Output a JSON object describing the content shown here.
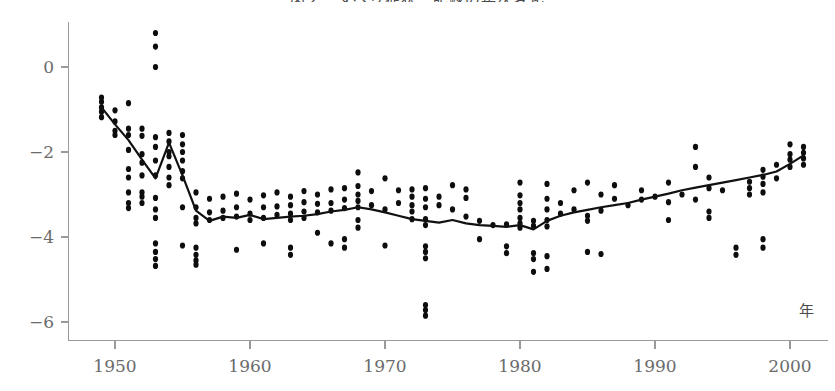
{
  "chart_data": {
    "type": "scatter",
    "title": "図２　すべり症状・記録の年次変化",
    "xlabel": "年",
    "ylabel": "",
    "xlim": [
      1948,
      2001.5
    ],
    "ylim": [
      -6.6,
      1.1
    ],
    "xticks": [
      1950,
      1960,
      1970,
      1980,
      1990,
      2000
    ],
    "xticklabels": [
      "1950",
      "1960",
      "1970",
      "1980",
      "1990",
      "2000"
    ],
    "yticks": [
      0,
      -2,
      -4,
      -6
    ],
    "yticklabels": [
      "0",
      "−2",
      "−4",
      "−6"
    ],
    "grid": false,
    "legend": null,
    "series": [
      {
        "name": "trend-line",
        "type": "line",
        "x": [
          1949,
          1950,
          1951,
          1952,
          1953,
          1954,
          1955,
          1956,
          1957,
          1958,
          1959,
          1960,
          1961,
          1962,
          1963,
          1964,
          1965,
          1966,
          1967,
          1968,
          1969,
          1970,
          1971,
          1972,
          1973,
          1974,
          1975,
          1976,
          1977,
          1978,
          1979,
          1980,
          1981,
          1982,
          1983,
          1984,
          1985,
          1986,
          1987,
          1988,
          1989,
          1990,
          1991,
          1992,
          1993,
          1994,
          1995,
          1996,
          1997,
          1998,
          1999,
          2000,
          2001
        ],
        "y": [
          -0.95,
          -1.35,
          -1.72,
          -2.18,
          -2.62,
          -1.78,
          -2.55,
          -3.38,
          -3.62,
          -3.52,
          -3.55,
          -3.48,
          -3.58,
          -3.55,
          -3.52,
          -3.5,
          -3.46,
          -3.4,
          -3.36,
          -3.3,
          -3.35,
          -3.42,
          -3.5,
          -3.58,
          -3.62,
          -3.66,
          -3.6,
          -3.68,
          -3.72,
          -3.74,
          -3.76,
          -3.72,
          -3.82,
          -3.62,
          -3.5,
          -3.42,
          -3.36,
          -3.3,
          -3.25,
          -3.2,
          -3.12,
          -3.05,
          -2.98,
          -2.9,
          -2.84,
          -2.78,
          -2.72,
          -2.66,
          -2.6,
          -2.54,
          -2.46,
          -2.28,
          -2.08
        ]
      },
      {
        "name": "observations",
        "type": "scatter",
        "points": [
          [
            1949,
            -0.72
          ],
          [
            1949,
            -0.82
          ],
          [
            1949,
            -0.95
          ],
          [
            1949,
            -1.05
          ],
          [
            1949,
            -1.18
          ],
          [
            1950,
            -1.02
          ],
          [
            1950,
            -1.28
          ],
          [
            1950,
            -1.5
          ],
          [
            1950,
            -1.6
          ],
          [
            1951,
            -0.85
          ],
          [
            1951,
            -1.45
          ],
          [
            1951,
            -1.6
          ],
          [
            1951,
            -1.95
          ],
          [
            1951,
            -2.4
          ],
          [
            1951,
            -2.6
          ],
          [
            1951,
            -2.95
          ],
          [
            1951,
            -3.2
          ],
          [
            1951,
            -3.32
          ],
          [
            1952,
            -1.45
          ],
          [
            1952,
            -1.62
          ],
          [
            1952,
            -2.05
          ],
          [
            1952,
            -2.25
          ],
          [
            1952,
            -2.55
          ],
          [
            1952,
            -2.95
          ],
          [
            1952,
            -3.05
          ],
          [
            1952,
            -3.2
          ],
          [
            1953,
            0.8
          ],
          [
            1953,
            0.48
          ],
          [
            1953,
            0.0
          ],
          [
            1953,
            -1.65
          ],
          [
            1953,
            -1.88
          ],
          [
            1953,
            -2.2
          ],
          [
            1953,
            -2.55
          ],
          [
            1953,
            -3.08
          ],
          [
            1953,
            -3.35
          ],
          [
            1953,
            -3.55
          ],
          [
            1953,
            -4.15
          ],
          [
            1953,
            -4.35
          ],
          [
            1953,
            -4.52
          ],
          [
            1953,
            -4.68
          ],
          [
            1954,
            -1.55
          ],
          [
            1954,
            -1.75
          ],
          [
            1954,
            -2.0
          ],
          [
            1954,
            -2.1
          ],
          [
            1954,
            -2.35
          ],
          [
            1954,
            -2.6
          ],
          [
            1954,
            -2.78
          ],
          [
            1955,
            -1.6
          ],
          [
            1955,
            -1.82
          ],
          [
            1955,
            -2.0
          ],
          [
            1955,
            -2.2
          ],
          [
            1955,
            -2.45
          ],
          [
            1955,
            -2.62
          ],
          [
            1955,
            -3.3
          ],
          [
            1955,
            -4.2
          ],
          [
            1956,
            -2.95
          ],
          [
            1956,
            -3.3
          ],
          [
            1956,
            -3.55
          ],
          [
            1956,
            -3.68
          ],
          [
            1956,
            -4.25
          ],
          [
            1956,
            -4.42
          ],
          [
            1956,
            -4.55
          ],
          [
            1956,
            -4.65
          ],
          [
            1957,
            -3.1
          ],
          [
            1957,
            -3.42
          ],
          [
            1957,
            -3.6
          ],
          [
            1958,
            -3.05
          ],
          [
            1958,
            -3.38
          ],
          [
            1958,
            -3.55
          ],
          [
            1959,
            -2.98
          ],
          [
            1959,
            -3.3
          ],
          [
            1959,
            -3.52
          ],
          [
            1959,
            -4.3
          ],
          [
            1960,
            -3.12
          ],
          [
            1960,
            -3.45
          ],
          [
            1960,
            -3.6
          ],
          [
            1961,
            -3.02
          ],
          [
            1961,
            -3.3
          ],
          [
            1961,
            -3.55
          ],
          [
            1961,
            -4.15
          ],
          [
            1962,
            -2.95
          ],
          [
            1962,
            -3.28
          ],
          [
            1962,
            -3.48
          ],
          [
            1963,
            -3.05
          ],
          [
            1963,
            -3.25
          ],
          [
            1963,
            -3.45
          ],
          [
            1963,
            -3.6
          ],
          [
            1963,
            -4.25
          ],
          [
            1963,
            -4.42
          ],
          [
            1964,
            -2.92
          ],
          [
            1964,
            -3.18
          ],
          [
            1964,
            -3.4
          ],
          [
            1964,
            -3.55
          ],
          [
            1965,
            -3.0
          ],
          [
            1965,
            -3.22
          ],
          [
            1965,
            -3.42
          ],
          [
            1965,
            -3.9
          ],
          [
            1966,
            -2.88
          ],
          [
            1966,
            -3.2
          ],
          [
            1966,
            -3.38
          ],
          [
            1966,
            -4.15
          ],
          [
            1967,
            -2.85
          ],
          [
            1967,
            -3.12
          ],
          [
            1967,
            -3.32
          ],
          [
            1967,
            -4.05
          ],
          [
            1967,
            -4.25
          ],
          [
            1968,
            -2.48
          ],
          [
            1968,
            -2.8
          ],
          [
            1968,
            -3.0
          ],
          [
            1968,
            -3.15
          ],
          [
            1968,
            -3.3
          ],
          [
            1968,
            -3.6
          ],
          [
            1968,
            -3.78
          ],
          [
            1969,
            -2.92
          ],
          [
            1969,
            -3.25
          ],
          [
            1970,
            -2.62
          ],
          [
            1970,
            -3.35
          ],
          [
            1970,
            -4.2
          ],
          [
            1971,
            -2.9
          ],
          [
            1971,
            -3.2
          ],
          [
            1972,
            -2.88
          ],
          [
            1972,
            -3.05
          ],
          [
            1972,
            -3.25
          ],
          [
            1972,
            -3.4
          ],
          [
            1972,
            -3.58
          ],
          [
            1973,
            -2.85
          ],
          [
            1973,
            -3.1
          ],
          [
            1973,
            -3.3
          ],
          [
            1973,
            -3.58
          ],
          [
            1973,
            -3.72
          ],
          [
            1973,
            -4.22
          ],
          [
            1973,
            -4.35
          ],
          [
            1973,
            -4.5
          ],
          [
            1973,
            -5.6
          ],
          [
            1973,
            -5.72
          ],
          [
            1973,
            -5.85
          ],
          [
            1974,
            -3.05
          ],
          [
            1974,
            -3.25
          ],
          [
            1975,
            -2.78
          ],
          [
            1975,
            -3.35
          ],
          [
            1976,
            -2.88
          ],
          [
            1976,
            -3.08
          ],
          [
            1976,
            -3.52
          ],
          [
            1977,
            -3.62
          ],
          [
            1977,
            -4.05
          ],
          [
            1978,
            -3.72
          ],
          [
            1979,
            -3.7
          ],
          [
            1979,
            -4.22
          ],
          [
            1979,
            -4.38
          ],
          [
            1980,
            -2.72
          ],
          [
            1980,
            -3.02
          ],
          [
            1980,
            -3.2
          ],
          [
            1980,
            -3.35
          ],
          [
            1980,
            -3.55
          ],
          [
            1980,
            -3.68
          ],
          [
            1980,
            -3.78
          ],
          [
            1981,
            -3.62
          ],
          [
            1981,
            -3.74
          ],
          [
            1981,
            -4.38
          ],
          [
            1981,
            -4.52
          ],
          [
            1981,
            -4.82
          ],
          [
            1982,
            -2.75
          ],
          [
            1982,
            -3.1
          ],
          [
            1982,
            -3.35
          ],
          [
            1982,
            -3.6
          ],
          [
            1982,
            -3.75
          ],
          [
            1982,
            -4.45
          ],
          [
            1982,
            -4.75
          ],
          [
            1983,
            -3.2
          ],
          [
            1983,
            -3.45
          ],
          [
            1984,
            -2.9
          ],
          [
            1984,
            -3.35
          ],
          [
            1985,
            -2.72
          ],
          [
            1985,
            -3.5
          ],
          [
            1985,
            -3.62
          ],
          [
            1985,
            -4.35
          ],
          [
            1986,
            -3.0
          ],
          [
            1986,
            -3.38
          ],
          [
            1986,
            -4.4
          ],
          [
            1987,
            -2.78
          ],
          [
            1987,
            -3.1
          ],
          [
            1988,
            -3.25
          ],
          [
            1989,
            -2.9
          ],
          [
            1989,
            -3.12
          ],
          [
            1990,
            -3.05
          ],
          [
            1991,
            -2.72
          ],
          [
            1991,
            -3.18
          ],
          [
            1991,
            -3.6
          ],
          [
            1992,
            -3.0
          ],
          [
            1993,
            -1.88
          ],
          [
            1993,
            -2.35
          ],
          [
            1993,
            -3.12
          ],
          [
            1994,
            -2.6
          ],
          [
            1994,
            -2.85
          ],
          [
            1994,
            -3.4
          ],
          [
            1994,
            -3.55
          ],
          [
            1995,
            -2.9
          ],
          [
            1996,
            -4.25
          ],
          [
            1996,
            -4.42
          ],
          [
            1997,
            -2.7
          ],
          [
            1997,
            -2.85
          ],
          [
            1997,
            -3.0
          ],
          [
            1998,
            -2.42
          ],
          [
            1998,
            -2.58
          ],
          [
            1998,
            -2.75
          ],
          [
            1998,
            -2.95
          ],
          [
            1998,
            -4.05
          ],
          [
            1998,
            -4.25
          ],
          [
            1999,
            -2.3
          ],
          [
            1999,
            -2.62
          ],
          [
            2000,
            -1.82
          ],
          [
            2000,
            -2.05
          ],
          [
            2000,
            -2.18
          ],
          [
            2000,
            -2.35
          ],
          [
            2001,
            -1.88
          ],
          [
            2001,
            -2.02
          ],
          [
            2001,
            -2.15
          ],
          [
            2001,
            -2.3
          ]
        ]
      }
    ]
  },
  "axes": {
    "x_axis_name": "年"
  }
}
